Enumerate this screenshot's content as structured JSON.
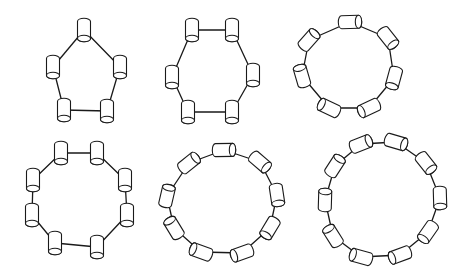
{
  "diagram": {
    "title": "",
    "colors": {
      "background": "#ffffff",
      "line": "#1a1a1a",
      "node_fill": "#ffffff"
    },
    "rings": [
      {
        "id": "ring-5",
        "node_count": 5,
        "shape": "pentagon"
      },
      {
        "id": "ring-6",
        "node_count": 6,
        "shape": "hexagon"
      },
      {
        "id": "ring-7",
        "node_count": 7,
        "shape": "heptagon"
      },
      {
        "id": "ring-8",
        "node_count": 8,
        "shape": "octagon"
      },
      {
        "id": "ring-9",
        "node_count": 9,
        "shape": "nonagon"
      },
      {
        "id": "ring-10",
        "node_count": 10,
        "shape": "decagon"
      }
    ],
    "node_icon": "cylinder-icon"
  }
}
